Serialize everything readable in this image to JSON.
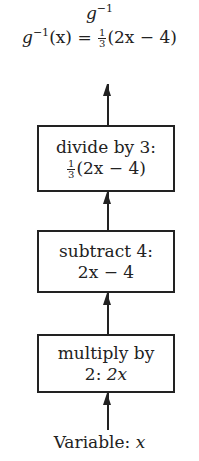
{
  "diagram": {
    "title": {
      "base": "g",
      "exponent": "−1"
    },
    "result_equation": {
      "lhs_base": "g",
      "lhs_exponent": "−1",
      "lhs_arg": "(x)",
      "equals": "=",
      "fraction_numerator": "1",
      "fraction_denominator": "3",
      "rhs_expr": "(2x − 4)"
    },
    "steps": [
      {
        "label": "divide by 3:",
        "frac_num": "1",
        "frac_den": "3",
        "expr": "(2x − 4)"
      },
      {
        "label": "subtract 4:",
        "expr": "2x − 4"
      },
      {
        "label": "multiply by",
        "label2": "2:",
        "expr": "2x"
      }
    ],
    "input": {
      "label": "Variable:",
      "var": "x"
    }
  }
}
